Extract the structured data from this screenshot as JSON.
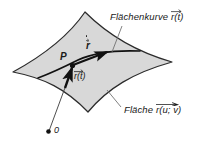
{
  "figure": {
    "title_alt": "Flaechenkurve auf einer Flaeche mit Ortsvektor und Tangentenvektor",
    "background_color": "#ffffff",
    "surface_fill": "#d8d8d8",
    "surface_stroke": "#2b2b2b",
    "curve_color": "#111111",
    "vector_color": "#111111",
    "text_color": "#1a1a1a"
  },
  "labels": {
    "surface_curve": {
      "text": "Flächenkurve",
      "vector_symbol": "r",
      "vector_arg": "(t)"
    },
    "surface": {
      "text": "Fläche",
      "vector_symbol": "r",
      "vector_arg": "(u; v)"
    },
    "point": {
      "text": "P"
    },
    "tangent_vector": {
      "symbol": "r",
      "has_dot": true,
      "has_arrow": true
    },
    "position_vector": {
      "symbol": "r",
      "arg": "(t)"
    },
    "origin": {
      "text": "0"
    }
  }
}
